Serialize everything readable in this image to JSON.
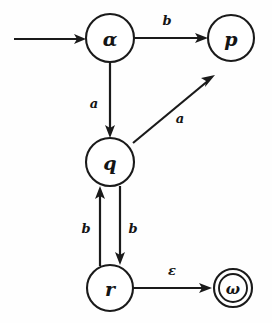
{
  "diagram": {
    "title": "Finite automaton state transition diagram",
    "type": "state-machine",
    "background_color": "#fefefe",
    "stroke_color": "#1a1a1a",
    "states": [
      {
        "id": "alpha",
        "label": "α",
        "kind": "start",
        "accepting": false,
        "cx": 110,
        "cy": 38,
        "r": 24
      },
      {
        "id": "p",
        "label": "p",
        "kind": "normal",
        "accepting": false,
        "cx": 231,
        "cy": 38,
        "r": 23
      },
      {
        "id": "q",
        "label": "q",
        "kind": "normal",
        "accepting": false,
        "cx": 110,
        "cy": 162,
        "r": 24
      },
      {
        "id": "r",
        "label": "r",
        "kind": "normal",
        "accepting": false,
        "cx": 110,
        "cy": 288,
        "r": 23
      },
      {
        "id": "omega",
        "label": "ω",
        "kind": "accepting",
        "accepting": true,
        "cx": 233,
        "cy": 288,
        "r": 19,
        "r_inner": 14
      }
    ],
    "transitions": [
      {
        "id": "alpha-p",
        "from": "alpha",
        "to": "p",
        "label": "b"
      },
      {
        "id": "alpha-q",
        "from": "alpha",
        "to": "q",
        "label": "a"
      },
      {
        "id": "q-p",
        "from": "q",
        "to": "p",
        "label": "a"
      },
      {
        "id": "q-r",
        "from": "q",
        "to": "r",
        "label": "b"
      },
      {
        "id": "r-q",
        "from": "r",
        "to": "q",
        "label": "b"
      },
      {
        "id": "r-omega",
        "from": "r",
        "to": "omega",
        "label": "ε"
      }
    ],
    "start_arrow": {
      "id": "start-arrow",
      "target": "alpha",
      "label": ""
    }
  }
}
